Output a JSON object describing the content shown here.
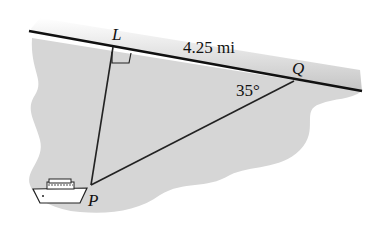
{
  "diagram": {
    "points": {
      "L": {
        "label": "L",
        "x": 112,
        "y": 46
      },
      "Q": {
        "label": "Q",
        "x": 294,
        "y": 79
      },
      "P": {
        "label": "P",
        "x": 91,
        "y": 185
      }
    },
    "distance_label": "4.25 mi",
    "angle_label": "35°",
    "right_angle_at": "L",
    "shore": "straight shoreline LQ",
    "boat_at": "P",
    "colors": {
      "water": "#d9d9d9",
      "shore_band": "#c8c8c8",
      "line": "#111111"
    }
  }
}
